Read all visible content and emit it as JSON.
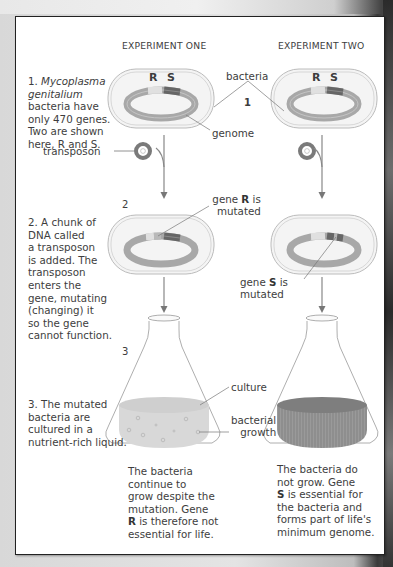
{
  "headers": {
    "experiment_one": "EXPERIMENT ONE",
    "experiment_two": "EXPERIMENT TWO"
  },
  "steps": [
    {
      "number": "1.",
      "lines": [
        "Mycoplasma",
        "genitalium",
        "bacteria have",
        "only 470 genes.",
        "Two are shown",
        "here, R and S."
      ]
    },
    {
      "number": "2.",
      "lines": [
        "A chunk of",
        "DNA called",
        "a transposon",
        "is added. The",
        "transposon",
        "enters the",
        "gene, mutating",
        "(changing) it",
        "so the gene",
        "cannot function."
      ]
    },
    {
      "number": "3.",
      "lines": [
        "The mutated",
        "bacteria are",
        "cultured in a",
        "nutrient-rich liquid."
      ]
    }
  ],
  "labels": {
    "bacteria": "bacteria",
    "genome": "genome",
    "transposon": "transposon",
    "gene_r_mutated_1": "gene",
    "gene_r_mutated_bold": "R",
    "gene_r_mutated_2": "is",
    "gene_r_mutated_3": "mutated",
    "gene_s_mutated_1": "gene",
    "gene_s_mutated_bold": "S",
    "gene_s_mutated_2": "is",
    "gene_s_mutated_3": "mutated",
    "culture": "culture",
    "bacterial_growth_1": "bacterial",
    "bacterial_growth_2": "growth",
    "gene_r": "R",
    "gene_s": "S",
    "marker_1": "1",
    "marker_2": "2",
    "marker_3": "3"
  },
  "results": {
    "experiment_one": [
      "The bacteria",
      "continue to",
      "grow despite the",
      "mutation. Gene",
      "R is therefore not",
      "essential for life."
    ],
    "experiment_two": [
      "The bacteria do",
      "not grow. Gene",
      "S is essential for",
      "the bacteria and",
      "forms part of life's",
      "minimum genome."
    ]
  },
  "colors": {
    "genome_ring": "#a8a8a8",
    "gene_r": "#d9d9d9",
    "gene_s": "#6a6a6a",
    "cell_fill": "#f2f2f2",
    "culture_growth": "#d6d6d6",
    "culture_no_growth": "#8f8f8f"
  }
}
